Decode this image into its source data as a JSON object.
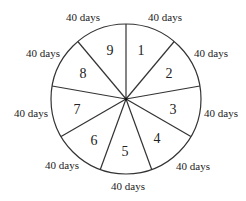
{
  "diagram": {
    "type": "pie-division",
    "sectors": [
      {
        "number": "1",
        "duration": "40 days"
      },
      {
        "number": "2",
        "duration": "40 days"
      },
      {
        "number": "3",
        "duration": "40 days"
      },
      {
        "number": "4",
        "duration": "40 days"
      },
      {
        "number": "5",
        "duration": "40 days"
      },
      {
        "number": "6",
        "duration": "40 days"
      },
      {
        "number": "7",
        "duration": "40 days"
      },
      {
        "number": "8",
        "duration": "40 days"
      },
      {
        "number": "9",
        "duration": "40 days"
      }
    ],
    "colors": {
      "stroke": "#333333",
      "fill": "#ffffff",
      "text": "#222222"
    }
  }
}
